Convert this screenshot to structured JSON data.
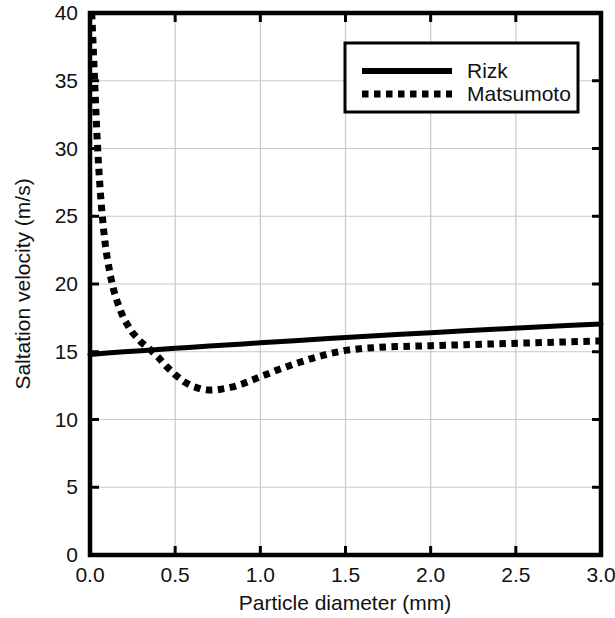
{
  "chart_data": {
    "type": "line",
    "title": "",
    "xlabel": "Particle diameter (mm)",
    "ylabel": "Saltation velocity (m/s)",
    "xlim": [
      0.0,
      3.0
    ],
    "ylim": [
      0,
      40
    ],
    "xticks": [
      "0.0",
      "0.5",
      "1.0",
      "1.5",
      "2.0",
      "2.5",
      "3.0"
    ],
    "xtick_values": [
      0.0,
      0.5,
      1.0,
      1.5,
      2.0,
      2.5,
      3.0
    ],
    "yticks": [
      "0",
      "5",
      "10",
      "15",
      "20",
      "25",
      "30",
      "35",
      "40"
    ],
    "ytick_values": [
      0,
      5,
      10,
      15,
      20,
      25,
      30,
      35,
      40
    ],
    "grid": true,
    "grid_color": "#c8c8c8",
    "axis_color": "#000000",
    "background": "#ffffff",
    "legend_position": "top-right",
    "series": [
      {
        "name": "Rizk",
        "style": "solid",
        "color": "#000000",
        "linewidth": 5,
        "x": [
          0.0,
          0.1,
          0.2,
          0.3,
          0.4,
          0.5,
          0.6,
          0.7,
          0.8,
          0.9,
          1.0,
          1.2,
          1.4,
          1.6,
          1.8,
          2.0,
          2.2,
          2.4,
          2.6,
          2.8,
          3.0
        ],
        "y": [
          14.8,
          14.9,
          15.0,
          15.08,
          15.17,
          15.25,
          15.33,
          15.42,
          15.5,
          15.58,
          15.66,
          15.82,
          15.98,
          16.13,
          16.27,
          16.41,
          16.55,
          16.68,
          16.81,
          16.94,
          17.05
        ]
      },
      {
        "name": "Matsumoto",
        "style": "dotted",
        "color": "#000000",
        "linewidth": 7,
        "x": [
          0.01,
          0.02,
          0.03,
          0.04,
          0.05,
          0.06,
          0.07,
          0.08,
          0.09,
          0.1,
          0.12,
          0.14,
          0.16,
          0.18,
          0.2,
          0.25,
          0.3,
          0.35,
          0.4,
          0.45,
          0.5,
          0.55,
          0.6,
          0.65,
          0.7,
          0.75,
          0.8,
          0.85,
          0.9,
          0.95,
          1.0,
          1.1,
          1.2,
          1.3,
          1.4,
          1.5,
          1.6,
          1.7,
          1.8,
          2.0,
          2.2,
          2.4,
          2.6,
          2.8,
          3.0
        ],
        "y": [
          40.0,
          37.2,
          34.1,
          31.2,
          28.8,
          26.9,
          25.3,
          24.0,
          22.9,
          22.0,
          20.6,
          19.5,
          18.7,
          18.0,
          17.4,
          16.4,
          15.7,
          15.2,
          14.6,
          13.9,
          13.3,
          12.8,
          12.45,
          12.25,
          12.17,
          12.2,
          12.3,
          12.45,
          12.65,
          12.9,
          13.15,
          13.65,
          14.1,
          14.5,
          14.85,
          15.1,
          15.25,
          15.33,
          15.38,
          15.45,
          15.52,
          15.59,
          15.66,
          15.73,
          15.8
        ]
      }
    ],
    "annotations": {
      "crossover_x": 0.37,
      "crossover_y": 15.1,
      "matsumoto_min_x": 0.72,
      "matsumoto_min_y": 12.17
    }
  },
  "legend": {
    "items": [
      {
        "label": "Rizk",
        "style": "solid"
      },
      {
        "label": "Matsumoto",
        "style": "dotted"
      }
    ]
  }
}
